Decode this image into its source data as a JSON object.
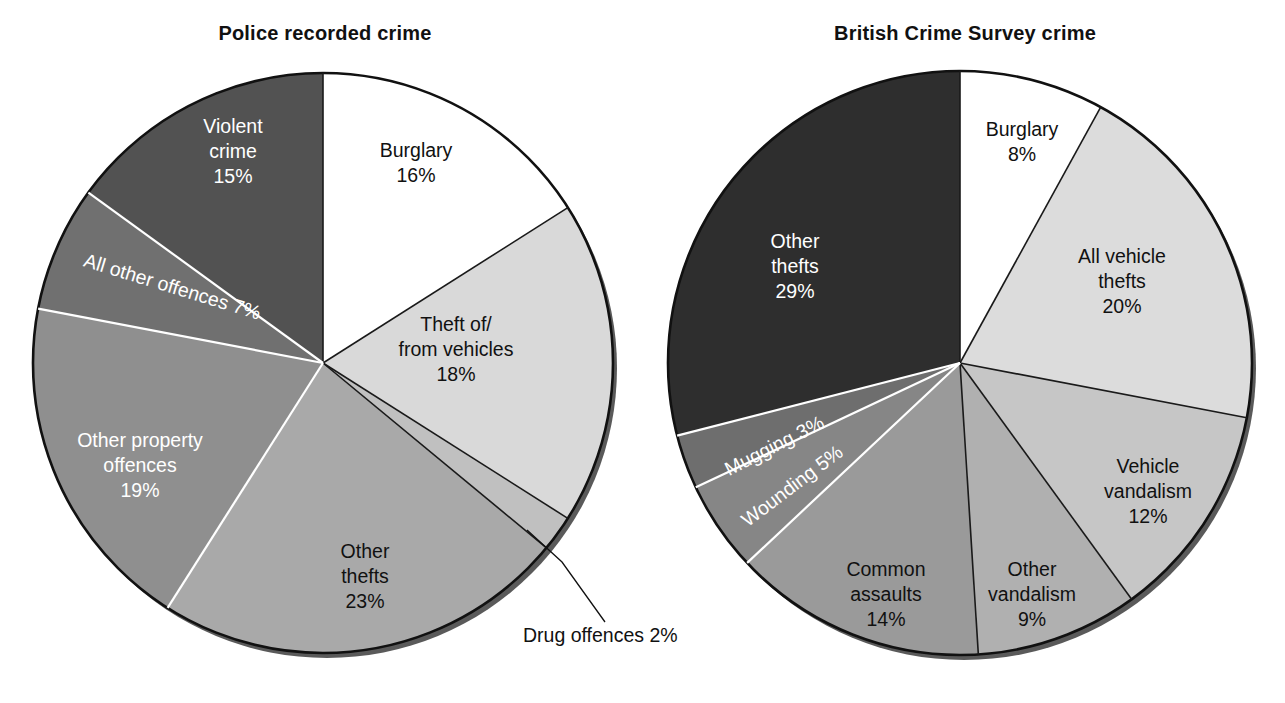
{
  "chart_data": [
    {
      "type": "pie",
      "title": "Police recorded crime",
      "xlabel": "",
      "ylabel": "",
      "legend_position": "none",
      "grid": false,
      "unit": "%",
      "categories": [
        "Burglary",
        "Theft of/from vehicles",
        "Drug offences",
        "Other thefts",
        "Other property offences",
        "All other offences",
        "Violent crime"
      ],
      "values": [
        16,
        18,
        2,
        23,
        19,
        7,
        15
      ],
      "slices": [
        {
          "label": "Burglary",
          "value": 16,
          "value_text": "16%",
          "label_lines": [
            "Burglary",
            "16%"
          ],
          "color": "#ffffff",
          "text_color": "#111111",
          "placement": "inside"
        },
        {
          "label": "Theft of/from vehicles",
          "value": 18,
          "value_text": "18%",
          "label_lines": [
            "Theft of/",
            "from vehicles",
            "18%"
          ],
          "color": "#d9d9d9",
          "text_color": "#111111",
          "placement": "inside"
        },
        {
          "label": "Drug offences",
          "value": 2,
          "value_text": "2%",
          "label_lines": [
            "Drug offences 2%"
          ],
          "color": "#c0c0c0",
          "text_color": "#111111",
          "placement": "callout"
        },
        {
          "label": "Other thefts",
          "value": 23,
          "value_text": "23%",
          "label_lines": [
            "Other",
            "thefts",
            "23%"
          ],
          "color": "#a9a9a9",
          "text_color": "#111111",
          "placement": "inside"
        },
        {
          "label": "Other property offences",
          "value": 19,
          "value_text": "19%",
          "label_lines": [
            "Other property",
            "offences",
            "19%"
          ],
          "color": "#8f8f8f",
          "text_color": "#ffffff",
          "placement": "inside"
        },
        {
          "label": "All other offences",
          "value": 7,
          "value_text": "7%",
          "label_lines": [
            "All other offences 7%"
          ],
          "color": "#707070",
          "text_color": "#ffffff",
          "placement": "inside-rotated"
        },
        {
          "label": "Violent crime",
          "value": 15,
          "value_text": "15%",
          "label_lines": [
            "Violent",
            "crime",
            "15%"
          ],
          "color": "#525252",
          "text_color": "#ffffff",
          "placement": "inside"
        }
      ]
    },
    {
      "type": "pie",
      "title": "British Crime Survey crime",
      "xlabel": "",
      "ylabel": "",
      "legend_position": "none",
      "grid": false,
      "unit": "%",
      "categories": [
        "Burglary",
        "All vehicle thefts",
        "Vehicle vandalism",
        "Other vandalism",
        "Common assaults",
        "Wounding",
        "Mugging",
        "Other thefts"
      ],
      "values": [
        8,
        20,
        12,
        9,
        14,
        5,
        3,
        29
      ],
      "slices": [
        {
          "label": "Burglary",
          "value": 8,
          "value_text": "8%",
          "label_lines": [
            "Burglary",
            "8%"
          ],
          "color": "#ffffff",
          "text_color": "#111111",
          "placement": "inside"
        },
        {
          "label": "All vehicle thefts",
          "value": 20,
          "value_text": "20%",
          "label_lines": [
            "All vehicle",
            "thefts",
            "20%"
          ],
          "color": "#dcdcdc",
          "text_color": "#111111",
          "placement": "inside"
        },
        {
          "label": "Vehicle vandalism",
          "value": 12,
          "value_text": "12%",
          "label_lines": [
            "Vehicle",
            "vandalism",
            "12%"
          ],
          "color": "#c6c6c6",
          "text_color": "#111111",
          "placement": "inside"
        },
        {
          "label": "Other vandalism",
          "value": 9,
          "value_text": "9%",
          "label_lines": [
            "Other",
            "vandalism",
            "9%"
          ],
          "color": "#b0b0b0",
          "text_color": "#111111",
          "placement": "inside"
        },
        {
          "label": "Common assaults",
          "value": 14,
          "value_text": "14%",
          "label_lines": [
            "Common",
            "assaults",
            "14%"
          ],
          "color": "#9a9a9a",
          "text_color": "#111111",
          "placement": "inside"
        },
        {
          "label": "Wounding",
          "value": 5,
          "value_text": "5%",
          "label_lines": [
            "Wounding 5%"
          ],
          "color": "#868686",
          "text_color": "#ffffff",
          "placement": "inside-rotated"
        },
        {
          "label": "Mugging",
          "value": 3,
          "value_text": "3%",
          "label_lines": [
            "Mugging 3%"
          ],
          "color": "#6e6e6e",
          "text_color": "#ffffff",
          "placement": "inside-rotated"
        },
        {
          "label": "Other thefts",
          "value": 29,
          "value_text": "29%",
          "label_lines": [
            "Other",
            "thefts",
            "29%"
          ],
          "color": "#2e2e2e",
          "text_color": "#ffffff",
          "placement": "inside"
        }
      ]
    }
  ],
  "charts": {
    "left": {
      "title": "Police recorded crime",
      "labels": {
        "burglary_1": "Burglary",
        "burglary_2": "16%",
        "vehicles_1": "Theft of/",
        "vehicles_2": "from vehicles",
        "vehicles_3": "18%",
        "otherthefts_1": "Other",
        "otherthefts_2": "thefts",
        "otherthefts_3": "23%",
        "property_1": "Other property",
        "property_2": "offences",
        "property_3": "19%",
        "allother": "All other offences 7%",
        "violent_1": "Violent",
        "violent_2": "crime",
        "violent_3": "15%",
        "drug": "Drug offences 2%"
      }
    },
    "right": {
      "title": "British Crime Survey crime",
      "labels": {
        "burglary_1": "Burglary",
        "burglary_2": "8%",
        "allvehicle_1": "All vehicle",
        "allvehicle_2": "thefts",
        "allvehicle_3": "20%",
        "vehvandal_1": "Vehicle",
        "vehvandal_2": "vandalism",
        "vehvandal_3": "12%",
        "othvandal_1": "Other",
        "othvandal_2": "vandalism",
        "othvandal_3": "9%",
        "assaults_1": "Common",
        "assaults_2": "assaults",
        "assaults_3": "14%",
        "wounding": "Wounding 5%",
        "mugging": "Mugging 3%",
        "otherthefts_1": "Other",
        "otherthefts_2": "thefts",
        "otherthefts_3": "29%"
      }
    }
  }
}
